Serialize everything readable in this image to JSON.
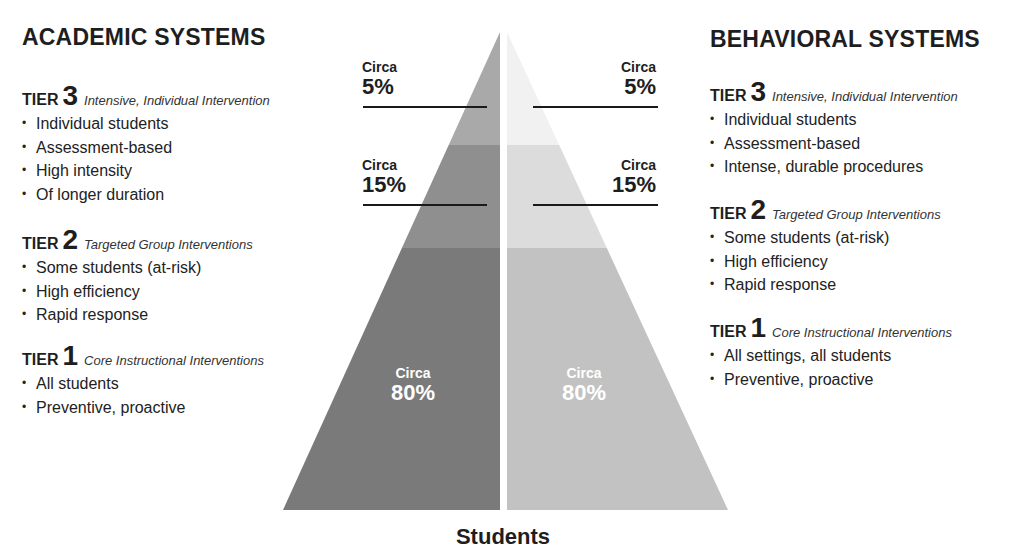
{
  "left": {
    "title": "ACADEMIC SYSTEMS",
    "tiers": [
      {
        "word": "TIER",
        "num": "3",
        "subtitle": "Intensive, Individual Intervention",
        "bullets": [
          "Individual students",
          "Assessment-based",
          "High intensity",
          "Of longer duration"
        ]
      },
      {
        "word": "TIER",
        "num": "2",
        "subtitle": "Targeted Group Interventions",
        "bullets": [
          "Some students (at-risk)",
          "High efficiency",
          "Rapid response"
        ]
      },
      {
        "word": "TIER",
        "num": "1",
        "subtitle": "Core Instructional Interventions",
        "bullets": [
          "All students",
          "Preventive, proactive"
        ]
      }
    ]
  },
  "right": {
    "title": "BEHAVIORAL SYSTEMS",
    "tiers": [
      {
        "word": "TIER",
        "num": "3",
        "subtitle": "Intensive, Individual Intervention",
        "bullets": [
          "Individual students",
          "Assessment-based",
          "Intense, durable procedures"
        ]
      },
      {
        "word": "TIER",
        "num": "2",
        "subtitle": "Targeted Group Interventions",
        "bullets": [
          "Some students (at-risk)",
          "High efficiency",
          "Rapid response"
        ]
      },
      {
        "word": "TIER",
        "num": "1",
        "subtitle": "Core Instructional Interventions",
        "bullets": [
          "All settings, all students",
          "Preventive, proactive"
        ]
      }
    ]
  },
  "pyramid": {
    "labels": {
      "left_top": {
        "circa": "Circa",
        "value": "5%"
      },
      "left_mid": {
        "circa": "Circa",
        "value": "15%"
      },
      "left_base": {
        "circa": "Circa",
        "value": "80%"
      },
      "right_top": {
        "circa": "Circa",
        "value": "5%"
      },
      "right_mid": {
        "circa": "Circa",
        "value": "15%"
      },
      "right_base": {
        "circa": "Circa",
        "value": "80%"
      }
    },
    "colors": {
      "left_top": "#a9a9a9",
      "left_mid": "#8f8f8f",
      "left_base": "#7a7a7a",
      "right_top": "#f1f1f1",
      "right_mid": "#dcdcdc",
      "right_base": "#c2c2c2",
      "rule": "#1a1a1a"
    },
    "axis_label": "Students"
  }
}
